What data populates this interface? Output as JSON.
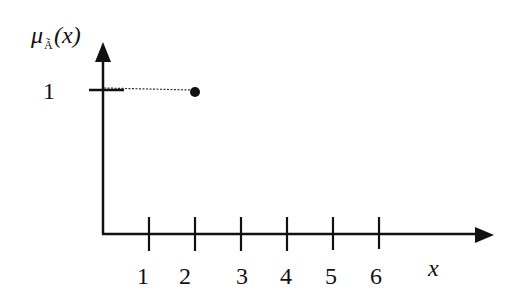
{
  "diagram": {
    "y_axis": {
      "label_main": "μ",
      "label_sub": "Ã",
      "label_arg": "(x)",
      "tick_label": "1"
    },
    "x_axis": {
      "label": "x",
      "ticks": [
        "1",
        "2",
        "3",
        "4",
        "5",
        "6"
      ]
    },
    "point": {
      "x": 2,
      "y": 1
    },
    "colors": {
      "ink": "#111111",
      "background": "#ffffff"
    }
  }
}
